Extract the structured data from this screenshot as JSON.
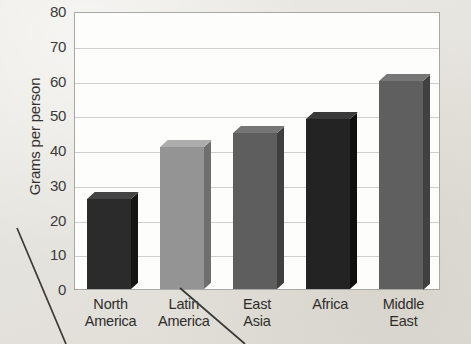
{
  "chart_data": {
    "type": "bar",
    "title": "",
    "xlabel": "",
    "ylabel": "Grams per person",
    "categories": [
      "North America",
      "Latin America",
      "East Asia",
      "Africa",
      "Middle East"
    ],
    "category_lines": [
      [
        "North",
        "America"
      ],
      [
        "Latin",
        "America"
      ],
      [
        "East",
        "Asia"
      ],
      [
        "Africa",
        ""
      ],
      [
        "Middle",
        "East"
      ]
    ],
    "values": [
      26,
      41,
      45,
      49,
      60
    ],
    "ylim": [
      0,
      80
    ],
    "ytick_step": 10,
    "yticks": [
      "0",
      "10",
      "20",
      "30",
      "40",
      "50",
      "60",
      "70",
      "80"
    ],
    "grid": true,
    "legend": "none",
    "bar_colors": [
      "#2b2b2b",
      "#949494",
      "#5e5e5e",
      "#232323",
      "#5f5f5f"
    ],
    "bar_top_colors": [
      "#444444",
      "#adadad",
      "#767676",
      "#3a3a3a",
      "#777777"
    ],
    "bar_side_colors": [
      "#151515",
      "#6f6f6f",
      "#3f3f3f",
      "#0f0f0f",
      "#404040"
    ],
    "background_color": "#e8e6e1",
    "plot_background_color": "#fdfdfb",
    "gridline_color": "#cfcfcb",
    "axis_color": "#a7a7a4"
  }
}
